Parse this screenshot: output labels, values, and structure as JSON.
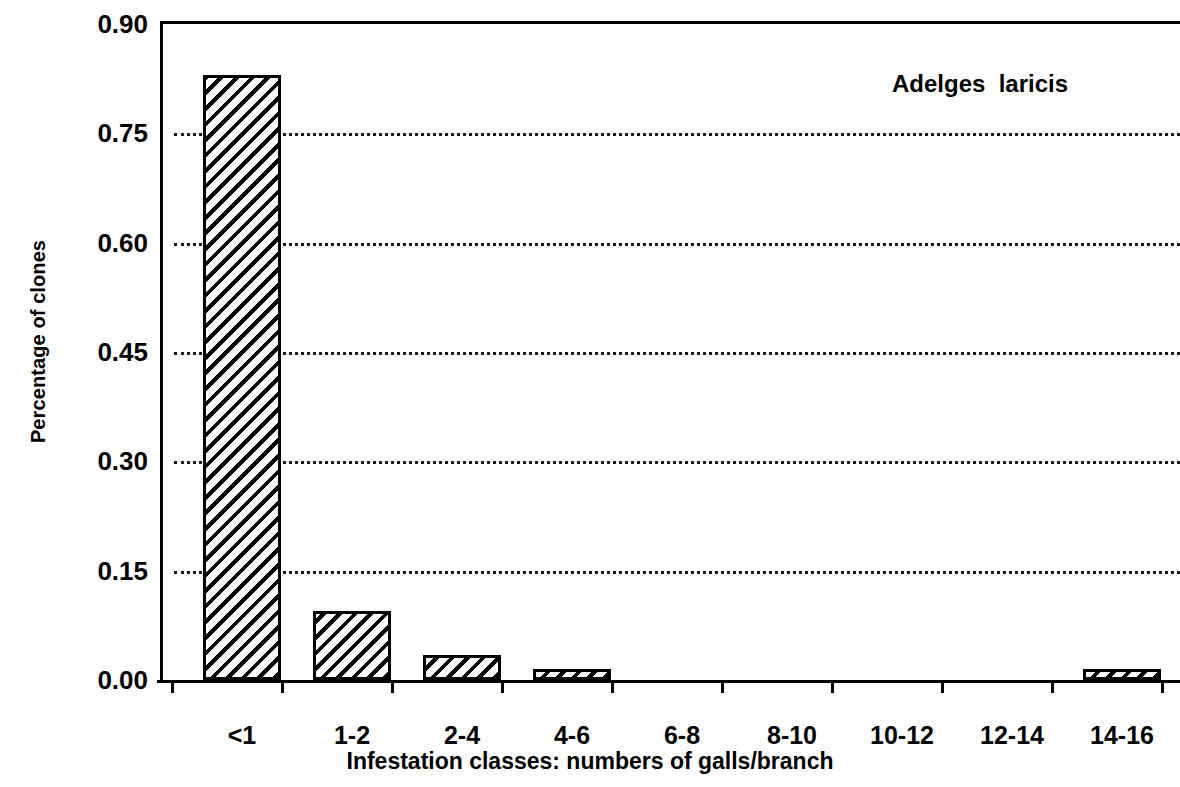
{
  "chart_data": {
    "type": "bar",
    "title": "",
    "annotation": "Adelges  laricis",
    "xlabel": "Infestation classes: numbers of galls/branch",
    "ylabel": "Percentage of clones",
    "categories": [
      "<1",
      "1-2",
      "2-4",
      "4-6",
      "6-8",
      "8-10",
      "10-12",
      "12-14",
      "14-16"
    ],
    "values": [
      0.83,
      0.095,
      0.035,
      0.015,
      0.0,
      0.0,
      0.0,
      0.0,
      0.015
    ],
    "ylim": [
      0.0,
      0.9
    ],
    "yticks": [
      0.0,
      0.15,
      0.3,
      0.45,
      0.6,
      0.75,
      0.9
    ],
    "ytick_labels": [
      "0.00",
      "0.15",
      "0.30",
      "0.45",
      "0.60",
      "0.75",
      "0.90"
    ],
    "grid": "horizontal-dotted",
    "legend": "none",
    "bar_fill": "diagonal-hatch",
    "colors": {
      "axis": "#000000",
      "bar_edge": "#000000",
      "bar_hatch": "#000000",
      "background": "#ffffff",
      "gridline": "#1a1a1a"
    }
  }
}
